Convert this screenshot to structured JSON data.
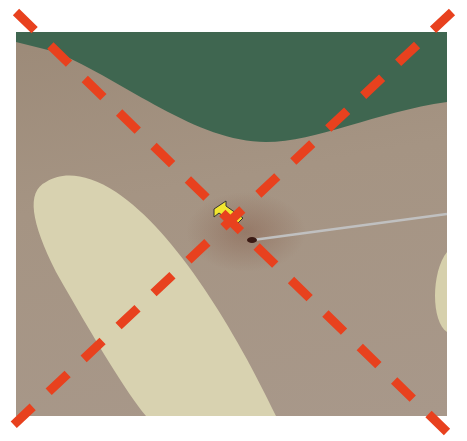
{
  "image": {
    "description": "Clinical photograph of skin with a thin wire probe inserted at a point marked by a yellow arrow, gloved finger at left, green surgical drape at top, and a red dashed X overlay",
    "colors": {
      "drape": "#3f6650",
      "skin": "#a59483",
      "glove": "#d6d0ac",
      "arrow": "#f2e630",
      "x_lines": "#e8411e",
      "probe": "#b8b8b8"
    }
  }
}
